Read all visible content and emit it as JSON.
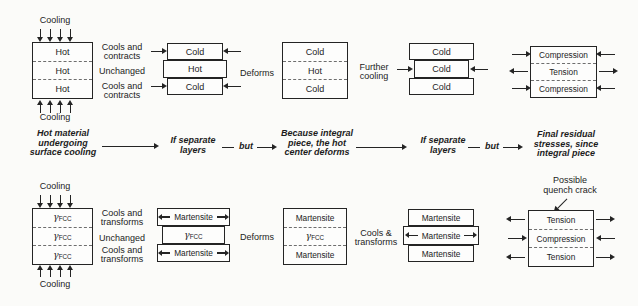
{
  "colors": {
    "ink": "#1c1c1c",
    "background": "#fbfbf9"
  },
  "figure": {
    "top": {
      "cooling_label": "Cooling",
      "initial_box": [
        "Hot",
        "Hot",
        "Hot"
      ],
      "surface_label_1": "Cools and",
      "surface_label_2": "contracts",
      "center_label": "Unchanged",
      "separate_stack": [
        "Cold",
        "Hot",
        "Cold"
      ],
      "deforms_label": "Deforms",
      "integral_stack": [
        "Cold",
        "Hot",
        "Cold"
      ],
      "further_cooling": [
        "Further",
        "cooling"
      ],
      "cooled_stack": [
        "Cold",
        "Cold",
        "Cold"
      ],
      "residual_stack": [
        "Compression",
        "Tension",
        "Compression"
      ]
    },
    "flow": {
      "caption1": [
        "Hot material",
        "undergoing",
        "surface cooling"
      ],
      "caption2": [
        "If separate",
        "layers"
      ],
      "but": "but",
      "caption3": [
        "Because integral",
        "piece, the hot",
        "center deforms"
      ],
      "caption4": [
        "If separate",
        "layers"
      ],
      "caption5": [
        "Final residual",
        "stresses, since",
        "integral piece"
      ]
    },
    "bottom": {
      "cooling_label": "Cooling",
      "gamma": "γ",
      "gamma_sub": "FCC",
      "surface_label_1": "Cools and",
      "surface_label_2": "transforms",
      "center_label": "Unchanged",
      "martensite": "Martensite",
      "deforms_label": "Deforms",
      "cools_transforms": [
        "Cools &",
        "transforms"
      ],
      "crack_note": [
        "Possible",
        "quench crack"
      ],
      "residual_stack": [
        "Tension",
        "Compression",
        "Tension"
      ]
    }
  }
}
